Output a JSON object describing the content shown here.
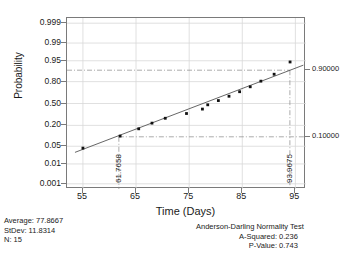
{
  "chart_data": {
    "type": "scatter",
    "title": "",
    "xlabel": "Time (Days)",
    "ylabel": "Probability",
    "xlim": [
      52,
      97
    ],
    "xticks": [
      55,
      65,
      75,
      85,
      95
    ],
    "ytick_labels": [
      "0.999",
      "0.99",
      "0.95",
      "0.80",
      "0.50",
      "0.20",
      "0.05",
      "0.01",
      "0.001"
    ],
    "ytick_values": [
      0.999,
      0.99,
      0.95,
      0.8,
      0.5,
      0.2,
      0.05,
      0.01,
      0.001
    ],
    "grid": true,
    "legend": "none",
    "points_x": [
      55.0,
      62.0,
      65.5,
      68.0,
      70.5,
      74.5,
      77.5,
      78.5,
      80.5,
      82.5,
      84.5,
      86.5,
      88.5,
      91.0,
      94.0
    ],
    "points_y": [
      0.043,
      0.105,
      0.165,
      0.225,
      0.285,
      0.35,
      0.415,
      0.48,
      0.545,
      0.61,
      0.675,
      0.74,
      0.805,
      0.87,
      0.945
    ],
    "fit_line": {
      "x": [
        53.5,
        96.5
      ],
      "y": [
        0.03,
        0.93
      ]
    },
    "reference_lines": [
      {
        "probability_label": "0.10000",
        "x_value": "61.7658",
        "probability": 0.1
      },
      {
        "probability_label": "0.90000",
        "x_value": "93.9675",
        "probability": 0.9
      }
    ],
    "right_axis_labels": [
      "0.90000",
      "0.10000"
    ],
    "vertical_annotations": [
      "61.7658",
      "93.9675"
    ]
  },
  "stats": {
    "average_label": "Average: 77.8667",
    "stdev_label": "StDev: 11.8314",
    "n_label": "N: 15"
  },
  "normality_test": {
    "title": "Anderson-Darling Normality Test",
    "a_squared": "A-Squared: 0.236",
    "p_value": "P-Value:  0.743"
  },
  "colors": {
    "axis": "#7a7a7a",
    "grid": "#d8d8d8",
    "point": "#111111",
    "line": "#555555",
    "reference": "#888888"
  }
}
